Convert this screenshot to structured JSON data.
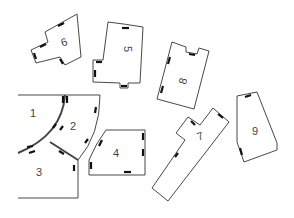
{
  "diagram": {
    "type": "pattern-pieces",
    "pieces": [
      {
        "id": "1",
        "label": "1"
      },
      {
        "id": "2",
        "label": "2"
      },
      {
        "id": "3",
        "label": "3"
      },
      {
        "id": "4",
        "label": "4"
      },
      {
        "id": "5",
        "label": "5"
      },
      {
        "id": "6",
        "label": "6"
      },
      {
        "id": "7",
        "label": "7"
      },
      {
        "id": "8",
        "label": "8"
      },
      {
        "id": "9",
        "label": "9"
      }
    ]
  }
}
